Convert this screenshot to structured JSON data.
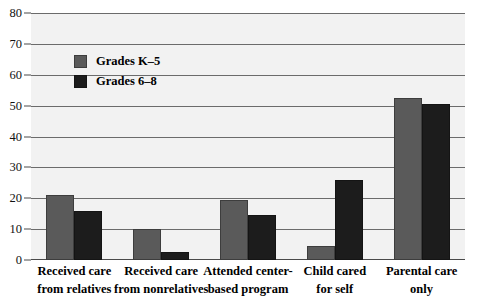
{
  "chart_data": {
    "type": "bar",
    "title": "",
    "xlabel": "",
    "ylabel": "",
    "ylim": [
      0,
      80
    ],
    "yticks": [
      0,
      10,
      20,
      30,
      40,
      50,
      60,
      70,
      80
    ],
    "ytick_labels": [
      "0",
      "10",
      "20",
      "30",
      "40",
      "50",
      "60",
      "70",
      "80"
    ],
    "grid": true,
    "legend_position": "upper-left-inside",
    "categories": [
      "Received care\nfrom relatives",
      "Received care\nfrom nonrelatives",
      "Attended center-\nbased program",
      "Child cared\nfor self",
      "Parental care\nonly"
    ],
    "category_lines": [
      [
        "Received care",
        "from relatives"
      ],
      [
        "Received care",
        "from nonrelatives"
      ],
      [
        "Attended center-",
        "based program"
      ],
      [
        "Child cared",
        "for self"
      ],
      [
        "Parental care",
        "only"
      ]
    ],
    "series": [
      {
        "name": "Grades K–5",
        "color": "#5a5a5a",
        "values": [
          21,
          10,
          19.5,
          4.5,
          52.5
        ]
      },
      {
        "name": "Grades 6–8",
        "color": "#1c1c1c",
        "values": [
          16,
          2.5,
          14.5,
          26,
          50.5
        ]
      }
    ]
  },
  "legend": {
    "items": [
      {
        "label": "Grades K–5",
        "color": "#5a5a5a"
      },
      {
        "label": "Grades 6–8",
        "color": "#1c1c1c"
      }
    ]
  },
  "colors": {
    "plot_background": "#f2f2f2",
    "gridline": "#6b6b6b",
    "axis": "#4a4a4a",
    "series_0": "#5a5a5a",
    "series_1": "#1c1c1c",
    "text": "#000000"
  }
}
